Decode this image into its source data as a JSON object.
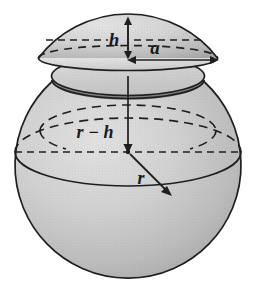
{
  "figure": {
    "background_color": "#ffffff",
    "outline_color": "#1a1a1a",
    "labels": {
      "cap_height": "h",
      "cap_base_radius": "a",
      "center_to_plane": "r − h",
      "sphere_radius": "r"
    },
    "shading": {
      "body_light": "#d7d7d7",
      "body_mid": "#bdbdbd",
      "body_dark": "#9e9e9e",
      "cut_ring_dark": "#8f8f8f",
      "cap_light": "#d9d9d9",
      "cap_dark": "#a8a8a8"
    }
  },
  "geometry": {
    "sphere_center": {
      "x": 128,
      "y": 152
    },
    "sphere_radius_px": 113,
    "cap_top": {
      "x": 128,
      "y": 17
    },
    "cut_plane_y": 58,
    "cap_base_right": {
      "x": 219,
      "y": 58
    },
    "radius_endpoint": {
      "x": 170,
      "y": 195
    }
  }
}
